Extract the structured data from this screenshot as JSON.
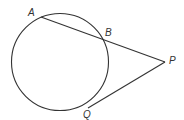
{
  "diagram": {
    "type": "circle-secant-tangent",
    "stroke_color": "#333333",
    "background": "#ffffff",
    "circle": {
      "cx": 60,
      "cy": 62,
      "r": 48.5
    },
    "points": {
      "A": {
        "label": "A",
        "x": 41,
        "y": 17,
        "label_x": 28,
        "label_y": 16
      },
      "B": {
        "label": "B",
        "x": 103,
        "y": 40,
        "label_x": 105,
        "label_y": 36
      },
      "P": {
        "label": "P",
        "x": 165,
        "y": 62,
        "label_x": 169,
        "label_y": 64
      },
      "Q": {
        "label": "Q",
        "x": 88,
        "y": 108,
        "label_x": 83,
        "label_y": 118
      }
    },
    "segments": [
      {
        "name": "secant-AP",
        "from": "A",
        "to": "P"
      },
      {
        "name": "tangent-PQ",
        "from": "P",
        "to": "Q"
      }
    ]
  }
}
